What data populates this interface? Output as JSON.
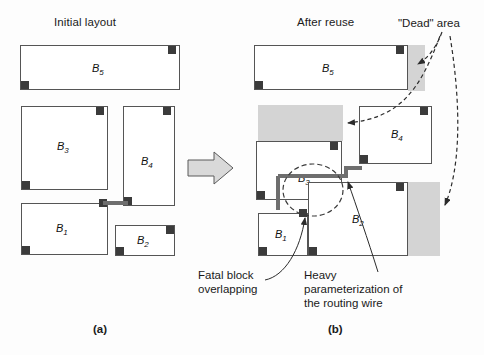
{
  "figure": {
    "left_panel": {
      "title": "Initial layout",
      "letter": "(a)",
      "blocks": [
        {
          "id": "B5",
          "label": "B",
          "sub": "5",
          "x": 20,
          "y": 45,
          "w": 160,
          "h": 45,
          "label_x": 92,
          "label_y": 62,
          "pins": [
            {
              "x": 168,
              "y": 46
            },
            {
              "x": 21,
              "y": 81
            }
          ]
        },
        {
          "id": "B3",
          "label": "B",
          "sub": "3",
          "x": 21,
          "y": 106,
          "w": 87,
          "h": 84,
          "label_x": 57,
          "label_y": 140,
          "pins": [
            {
              "x": 96,
              "y": 107
            },
            {
              "x": 22,
              "y": 181
            }
          ]
        },
        {
          "id": "B4",
          "label": "B",
          "sub": "4",
          "x": 123,
          "y": 106,
          "w": 52,
          "h": 100,
          "label_x": 141,
          "label_y": 155,
          "pins": [
            {
              "x": 163,
              "y": 107
            },
            {
              "x": 124,
              "y": 197
            }
          ]
        },
        {
          "id": "B1",
          "label": "B",
          "sub": "1",
          "x": 21,
          "y": 203,
          "w": 87,
          "h": 52,
          "label_x": 56,
          "label_y": 222,
          "pins": [
            {
              "x": 99,
              "y": 199
            },
            {
              "x": 22,
              "y": 246
            }
          ]
        },
        {
          "id": "B2",
          "label": "B",
          "sub": "2",
          "x": 115,
          "y": 225,
          "w": 60,
          "h": 31,
          "label_x": 137,
          "label_y": 234,
          "pins": [
            {
              "x": 166,
              "y": 226
            },
            {
              "x": 116,
              "y": 247
            }
          ]
        }
      ]
    },
    "right_panel": {
      "title": "After reuse",
      "letter": "(b)",
      "blocks": [
        {
          "id": "B5",
          "label": "B",
          "sub": "5",
          "x": 254,
          "y": 45,
          "w": 154,
          "h": 45,
          "label_x": 322,
          "label_y": 62,
          "pins": [
            {
              "x": 396,
              "y": 46
            },
            {
              "x": 255,
              "y": 81
            }
          ]
        },
        {
          "id": "B3",
          "label": "B",
          "sub": "3",
          "x": 256,
          "y": 141,
          "w": 86,
          "h": 59,
          "label_x": 298,
          "label_y": 172,
          "pins": [
            {
              "x": 330,
              "y": 142
            },
            {
              "x": 257,
              "y": 191
            }
          ]
        },
        {
          "id": "B4",
          "label": "B",
          "sub": "4",
          "x": 359,
          "y": 106,
          "w": 73,
          "h": 58,
          "label_x": 391,
          "label_y": 128,
          "pins": [
            {
              "x": 420,
              "y": 107
            },
            {
              "x": 360,
              "y": 155
            }
          ]
        },
        {
          "id": "B1",
          "label": "B",
          "sub": "1",
          "x": 258,
          "y": 213,
          "w": 50,
          "h": 43,
          "label_x": 275,
          "label_y": 228,
          "pins": [
            {
              "x": 299,
              "y": 209
            },
            {
              "x": 259,
              "y": 247
            }
          ]
        },
        {
          "id": "B2",
          "label": "B",
          "sub": "2",
          "x": 308,
          "y": 182,
          "w": 100,
          "h": 74,
          "label_x": 352,
          "label_y": 213,
          "pins": [
            {
              "x": 396,
              "y": 183
            },
            {
              "x": 309,
              "y": 247
            }
          ]
        }
      ],
      "dead_areas": [
        {
          "name": "dead-area-top-right",
          "x": 408,
          "y": 45,
          "w": 17,
          "h": 46
        },
        {
          "name": "dead-area-middle-left",
          "x": 258,
          "y": 105,
          "w": 85,
          "h": 36
        },
        {
          "name": "dead-area-bottom-right",
          "x": 408,
          "y": 182,
          "w": 32,
          "h": 74
        }
      ]
    },
    "annotations": {
      "dead_area": "\"Dead\" area",
      "fatal_overlap": "Fatal block\noverlapping",
      "heavy_param": "Heavy\nparameterization of\nthe routing wire"
    },
    "colors": {
      "dead_area_fill": "#d4d4d4",
      "block_border": "#555555",
      "pin_fill": "#3b3b3b",
      "wire": "#6e6e6e",
      "arrow_fill": "#d9d9d9",
      "text": "#1a1a1a"
    }
  }
}
